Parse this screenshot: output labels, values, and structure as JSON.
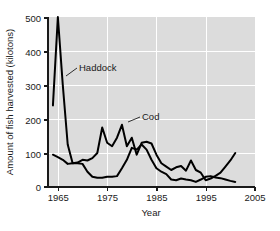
{
  "chart_data": {
    "type": "line",
    "title": "",
    "xlabel": "Year",
    "ylabel": "Amount of fish harvested (kilotons)",
    "xlim": [
      1963,
      2005
    ],
    "ylim": [
      0,
      500
    ],
    "xticks": [
      1965,
      1975,
      1985,
      1995,
      2005
    ],
    "yticks": [
      0,
      100,
      200,
      300,
      400,
      500
    ],
    "grid": true,
    "legend_position": "inline-annotation",
    "annotations": [
      {
        "text": "Haddock",
        "points_to_year": 1966,
        "points_to_value": 360
      },
      {
        "text": "Cod",
        "points_to_year": 1978,
        "points_to_value": 183
      }
    ],
    "x": [
      1964,
      1965,
      1966,
      1967,
      1968,
      1969,
      1970,
      1971,
      1972,
      1973,
      1974,
      1975,
      1976,
      1977,
      1978,
      1979,
      1980,
      1981,
      1982,
      1983,
      1984,
      1985,
      1986,
      1987,
      1988,
      1989,
      1990,
      1991,
      1992,
      1993,
      1994,
      1995,
      1996,
      1997,
      1998,
      1999,
      2000,
      2001
    ],
    "series": [
      {
        "name": "Haddock",
        "values": [
          240,
          500,
          300,
          125,
          70,
          70,
          68,
          45,
          30,
          27,
          27,
          30,
          30,
          32,
          55,
          80,
          115,
          110,
          125,
          110,
          80,
          55,
          45,
          38,
          22,
          20,
          25,
          22,
          20,
          15,
          22,
          30,
          32,
          28,
          26,
          22,
          18,
          15
        ]
      },
      {
        "name": "Cod",
        "values": [
          95,
          88,
          80,
          68,
          70,
          72,
          80,
          78,
          85,
          100,
          175,
          130,
          120,
          145,
          183,
          120,
          145,
          95,
          130,
          133,
          128,
          95,
          70,
          60,
          50,
          58,
          62,
          48,
          78,
          50,
          42,
          20,
          25,
          33,
          42,
          60,
          78,
          100
        ]
      }
    ],
    "colors": {
      "line": "#000000",
      "plot_background": "#dcdcdc",
      "gridline": "#ffffff",
      "text": "#1a1a1a"
    }
  }
}
